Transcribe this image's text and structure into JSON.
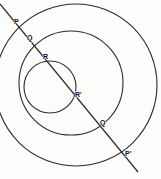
{
  "figure": {
    "type": "geometry-diagram",
    "background_color": "#fdfdfc",
    "stroke_color": "#2b2b2b",
    "label_color": "#111111",
    "canvas": {
      "width": 161,
      "height": 179
    },
    "circles": [
      {
        "name": "outer-circle",
        "cx": 76,
        "cy": 85,
        "r": 81
      },
      {
        "name": "middle-circle",
        "cx": 71,
        "cy": 83,
        "r": 52
      },
      {
        "name": "inner-circle",
        "cx": 50,
        "cy": 87,
        "r": 26
      }
    ],
    "transversal": {
      "name": "transversal-line",
      "x1": 0,
      "y1": 4,
      "x2": 138,
      "y2": 172
    },
    "points": [
      {
        "id": "P",
        "label": "P",
        "x": 16,
        "y": 24,
        "label_x": 14,
        "label_y": 18
      },
      {
        "id": "Q",
        "label": "Q",
        "x": 29,
        "y": 40,
        "label_x": 27,
        "label_y": 34
      },
      {
        "id": "R",
        "label": "R",
        "x": 45,
        "y": 59,
        "label_x": 43,
        "label_y": 53
      },
      {
        "id": "R'",
        "label": "R'",
        "x": 77,
        "y": 97,
        "label_x": 75,
        "label_y": 91
      },
      {
        "id": "Q'",
        "label": "Q'",
        "x": 101,
        "y": 125,
        "label_x": 100,
        "label_y": 119
      },
      {
        "id": "P'",
        "label": "P'",
        "x": 126,
        "y": 156,
        "label_x": 125,
        "label_y": 150
      }
    ]
  }
}
